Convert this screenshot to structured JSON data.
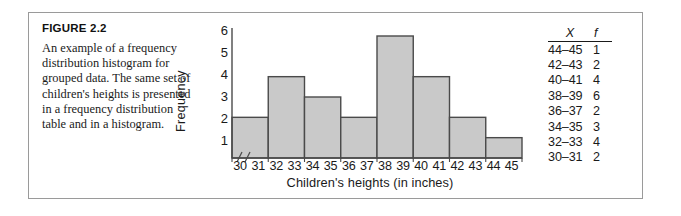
{
  "figure": {
    "title": "FIGURE 2.2",
    "caption": "An example of a frequency distribution histogram for grouped data. The same set of children's heights is presented in a frequency distribution table and in a histogram."
  },
  "table": {
    "headers": [
      "X",
      "f"
    ],
    "rows": [
      {
        "x": "44–45",
        "f": "1"
      },
      {
        "x": "42–43",
        "f": "2"
      },
      {
        "x": "40–41",
        "f": "4"
      },
      {
        "x": "38–39",
        "f": "6"
      },
      {
        "x": "36–37",
        "f": "2"
      },
      {
        "x": "34–35",
        "f": "3"
      },
      {
        "x": "32–33",
        "f": "4"
      },
      {
        "x": "30–31",
        "f": "2"
      }
    ]
  },
  "colors": {
    "bar_fill": "#c9c9c9",
    "bar_edge": "#4a4a4a",
    "axis": "#4a4a4a",
    "border": "#9a9a9a",
    "text": "#1a1a1a"
  },
  "chart_data": {
    "type": "bar",
    "title": "",
    "xlabel": "Children's heights (in inches)",
    "ylabel": "Frequency",
    "categories": [
      "30–31",
      "32–33",
      "34–35",
      "36–37",
      "38–39",
      "40–41",
      "42–43",
      "44–45"
    ],
    "values": [
      2,
      4,
      3,
      2,
      6,
      4,
      2,
      1
    ],
    "ylim": [
      0,
      6
    ],
    "yticks": [
      6,
      5,
      4,
      3,
      2,
      1
    ],
    "ytick_labels": [
      "6",
      "5",
      "4",
      "3",
      "2",
      "1"
    ],
    "xticks": [
      30,
      31,
      32,
      33,
      34,
      35,
      36,
      37,
      38,
      39,
      40,
      41,
      42,
      43,
      44,
      45
    ],
    "xtick_labels": [
      "30",
      "31",
      "32",
      "33",
      "34",
      "35",
      "36",
      "37",
      "38",
      "39",
      "40",
      "41",
      "42",
      "43",
      "44",
      "45"
    ],
    "grid": false,
    "legend": false,
    "axis_break": true,
    "axis_break_symbol": "⁄⁄"
  }
}
